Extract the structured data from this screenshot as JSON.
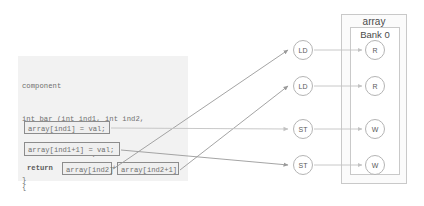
{
  "diagram": {
    "code": {
      "lines": [
        {
          "text": "component",
          "style": "plain"
        },
        {
          "text": "int bar (int ind1, int ind2,",
          "style": "plain"
        },
        {
          "text": "         int val)",
          "style": "plain"
        },
        {
          "text": "{",
          "style": "plain"
        }
      ],
      "decl_prefix": "  hls_memory int array[",
      "decl_size": "1024",
      "decl_suffix": "];",
      "return_keyword": "return",
      "plus_operator": "+",
      "close_brace": "}"
    },
    "expressions": {
      "store1": "array[ind1] = val;",
      "store2": "array[ind1+1] = val;",
      "load1": "array[ind2]",
      "load2": "array[ind2+1]"
    },
    "memory": {
      "outer_label": "array",
      "inner_label": "Bank 0"
    },
    "operations": [
      {
        "id": "ld1",
        "label": "LD"
      },
      {
        "id": "ld2",
        "label": "LD"
      },
      {
        "id": "st1",
        "label": "ST"
      },
      {
        "id": "st2",
        "label": "ST"
      }
    ],
    "ports": [
      {
        "id": "r1",
        "label": "R"
      },
      {
        "id": "r2",
        "label": "R"
      },
      {
        "id": "w1",
        "label": "W"
      },
      {
        "id": "w2",
        "label": "W"
      }
    ],
    "colors": {
      "background": "#ffffff",
      "code_panel": "#f2f2f2",
      "code_text": "#6f6f6f",
      "box_border": "#8c8c8c",
      "wire": "#9a9a9a",
      "wire_light": "#c2c2c2",
      "mem_border": "#c9c9c9",
      "number": "#c88c8c"
    }
  }
}
